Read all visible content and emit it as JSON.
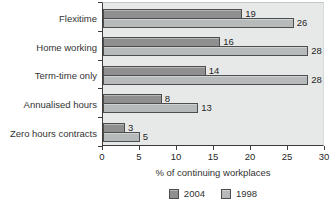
{
  "chart_data": {
    "type": "bar",
    "orientation": "horizontal",
    "title": "",
    "xlabel": "% of continuing workplaces",
    "ylabel": "",
    "xlim": [
      0,
      30
    ],
    "xticks": [
      0,
      5,
      10,
      15,
      20,
      25,
      30
    ],
    "grid": false,
    "legend_position": "bottom",
    "plot_background": "#e7e9e9",
    "bar_border_color": "#4d4d4d",
    "categories": [
      "Flexitime",
      "Home working",
      "Term-time only",
      "Annualised hours",
      "Zero hours contracts"
    ],
    "series": [
      {
        "name": "2004",
        "color": "#8f8f8f",
        "values": [
          19,
          16,
          14,
          8,
          3
        ]
      },
      {
        "name": "1998",
        "color": "#b6baba",
        "values": [
          26,
          28,
          28,
          13,
          5
        ]
      }
    ]
  }
}
